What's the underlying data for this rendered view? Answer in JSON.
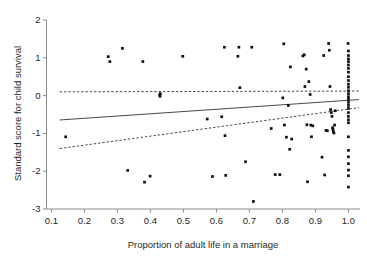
{
  "chart_data": {
    "type": "scatter",
    "title": "",
    "xlabel": "Proportion of adult life in a marriage",
    "ylabel": "Standard score for child survival",
    "xlim": [
      0.085,
      1.035
    ],
    "ylim": [
      -3,
      2
    ],
    "xticks": [
      0.1,
      0.2,
      0.3,
      0.4,
      0.5,
      0.6,
      0.7,
      0.8,
      0.9,
      1.0
    ],
    "xtick_labels": [
      "0.1",
      "0.2",
      "0.3",
      "0.4",
      "0.5",
      "0.6",
      "0.7",
      "0.8",
      "0.9",
      "1.0"
    ],
    "yticks": [
      2,
      1,
      0,
      -1,
      -2,
      -3
    ],
    "ytick_labels": [
      "2",
      "1",
      "0",
      "-1",
      "-2",
      "-3"
    ],
    "grid": false,
    "legend": "none",
    "marker_color": "#101010",
    "line_color": "#4a4a4a",
    "axis_color": "#8a8a8a",
    "points": [
      [
        0.143,
        -1.09
      ],
      [
        0.272,
        1.03
      ],
      [
        0.277,
        0.9
      ],
      [
        0.315,
        1.25
      ],
      [
        0.331,
        -1.98
      ],
      [
        0.377,
        0.9
      ],
      [
        0.382,
        -2.29
      ],
      [
        0.399,
        -2.13
      ],
      [
        0.428,
        0.02
      ],
      [
        0.429,
        -0.02
      ],
      [
        0.43,
        0.05
      ],
      [
        0.498,
        1.04
      ],
      [
        0.572,
        -0.62
      ],
      [
        0.588,
        -2.14
      ],
      [
        0.616,
        -0.56
      ],
      [
        0.624,
        1.28
      ],
      [
        0.626,
        -1.06
      ],
      [
        0.628,
        -2.11
      ],
      [
        0.665,
        1.04
      ],
      [
        0.668,
        1.28
      ],
      [
        0.671,
        0.21
      ],
      [
        0.688,
        -1.75
      ],
      [
        0.707,
        1.28
      ],
      [
        0.712,
        -2.8
      ],
      [
        0.766,
        -0.87
      ],
      [
        0.778,
        -2.09
      ],
      [
        0.792,
        -2.09
      ],
      [
        0.801,
        -0.06
      ],
      [
        0.804,
        1.37
      ],
      [
        0.806,
        -0.78
      ],
      [
        0.812,
        -1.1
      ],
      [
        0.818,
        -0.26
      ],
      [
        0.822,
        -1.42
      ],
      [
        0.824,
        0.76
      ],
      [
        0.828,
        -1.15
      ],
      [
        0.862,
        1.05
      ],
      [
        0.866,
        1.08
      ],
      [
        0.868,
        0.24
      ],
      [
        0.872,
        0.7
      ],
      [
        0.874,
        -0.77
      ],
      [
        0.876,
        -2.28
      ],
      [
        0.88,
        0.37
      ],
      [
        0.884,
        0.03
      ],
      [
        0.886,
        -0.78
      ],
      [
        0.888,
        -1.09
      ],
      [
        0.892,
        -0.8
      ],
      [
        0.92,
        -1.63
      ],
      [
        0.925,
        1.06
      ],
      [
        0.928,
        -2.1
      ],
      [
        0.932,
        -0.92
      ],
      [
        0.936,
        -0.93
      ],
      [
        0.94,
        1.38
      ],
      [
        0.942,
        1.2
      ],
      [
        0.944,
        0.24
      ],
      [
        0.946,
        -0.37
      ],
      [
        0.948,
        -0.45
      ],
      [
        0.95,
        -0.55
      ],
      [
        0.952,
        -0.85
      ],
      [
        0.953,
        -0.9
      ],
      [
        0.954,
        -0.95
      ],
      [
        0.956,
        -0.99
      ],
      [
        0.958,
        -0.78
      ],
      [
        0.96,
        -0.4
      ],
      [
        0.999,
        1.38
      ],
      [
        1.0,
        1.18
      ],
      [
        1.0,
        1.06
      ],
      [
        1.0,
        0.97
      ],
      [
        1.0,
        0.9
      ],
      [
        1.0,
        0.81
      ],
      [
        1.0,
        0.72
      ],
      [
        1.0,
        0.62
      ],
      [
        1.0,
        0.5
      ],
      [
        1.0,
        0.4
      ],
      [
        1.0,
        0.3
      ],
      [
        1.0,
        0.22
      ],
      [
        1.0,
        0.13
      ],
      [
        1.0,
        0.05
      ],
      [
        1.0,
        -0.03
      ],
      [
        1.0,
        -0.1
      ],
      [
        1.0,
        -0.18
      ],
      [
        1.0,
        -0.26
      ],
      [
        1.0,
        -0.34
      ],
      [
        1.0,
        -0.45
      ],
      [
        1.0,
        -0.55
      ],
      [
        1.0,
        -0.64
      ],
      [
        1.0,
        -0.72
      ],
      [
        1.0,
        -1.09
      ],
      [
        1.0,
        -1.45
      ],
      [
        1.0,
        -1.62
      ],
      [
        1.0,
        -1.8
      ],
      [
        1.0,
        -1.97
      ],
      [
        1.0,
        -2.12
      ],
      [
        1.0,
        -2.42
      ]
    ],
    "fit_line": {
      "style": "solid",
      "x": [
        0.125,
        1.032
      ],
      "y": [
        -0.645,
        -0.105
      ]
    },
    "confidence_bands": [
      {
        "name": "upper",
        "style": "dashed",
        "x": [
          0.125,
          1.032
        ],
        "y": [
          0.1,
          0.12
        ]
      },
      {
        "name": "lower",
        "style": "dashed",
        "x": [
          0.125,
          1.032
        ],
        "y": [
          -1.4,
          -0.32
        ]
      }
    ]
  }
}
